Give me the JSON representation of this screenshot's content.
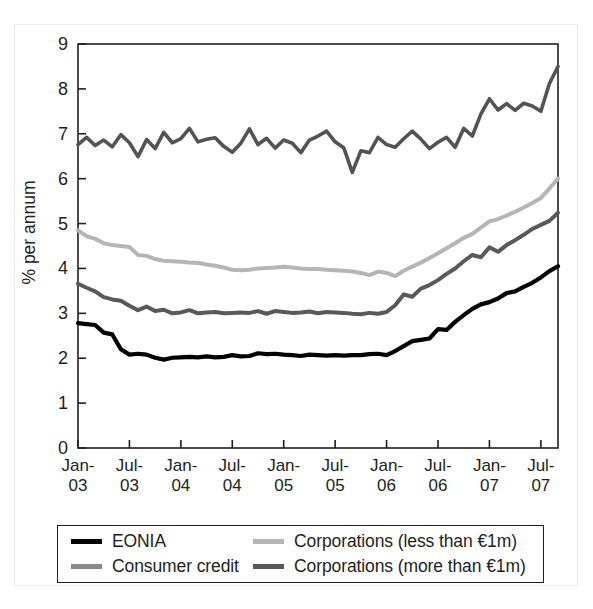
{
  "chart_data": {
    "type": "line",
    "title": "",
    "subtitle": "",
    "xlabel": "",
    "ylabel": "% per annum",
    "ylim": [
      0,
      9
    ],
    "yticks": [
      0,
      1,
      2,
      3,
      4,
      5,
      6,
      7,
      8,
      9
    ],
    "ytick_labels": [
      "0",
      "1",
      "2",
      "3",
      "4",
      "5",
      "6",
      "7",
      "8",
      "9"
    ],
    "grid": false,
    "legend_position": "below-plot",
    "x_start": "Jan-03",
    "x_end": "Sep-07",
    "x_frequency": "monthly",
    "xtick_labels": [
      {
        "line1": "Jan-",
        "line2": "03"
      },
      {
        "line1": "Jul-",
        "line2": "03"
      },
      {
        "line1": "Jan-",
        "line2": "04"
      },
      {
        "line1": "Jul-",
        "line2": "04"
      },
      {
        "line1": "Jan-",
        "line2": "05"
      },
      {
        "line1": "Jul-",
        "line2": "05"
      },
      {
        "line1": "Jan-",
        "line2": "06"
      },
      {
        "line1": "Jul-",
        "line2": "06"
      },
      {
        "line1": "Jan-",
        "line2": "07"
      },
      {
        "line1": "Jul-",
        "line2": "07"
      }
    ],
    "x": [
      "Jan-03",
      "Feb-03",
      "Mar-03",
      "Apr-03",
      "May-03",
      "Jun-03",
      "Jul-03",
      "Aug-03",
      "Sep-03",
      "Oct-03",
      "Nov-03",
      "Dec-03",
      "Jan-04",
      "Feb-04",
      "Mar-04",
      "Apr-04",
      "May-04",
      "Jun-04",
      "Jul-04",
      "Aug-04",
      "Sep-04",
      "Oct-04",
      "Nov-04",
      "Dec-04",
      "Jan-05",
      "Feb-05",
      "Mar-05",
      "Apr-05",
      "May-05",
      "Jun-05",
      "Jul-05",
      "Aug-05",
      "Sep-05",
      "Oct-05",
      "Nov-05",
      "Dec-05",
      "Jan-06",
      "Feb-06",
      "Mar-06",
      "Apr-06",
      "May-06",
      "Jun-06",
      "Jul-06",
      "Aug-06",
      "Sep-06",
      "Oct-06",
      "Nov-06",
      "Dec-06",
      "Jan-07",
      "Feb-07",
      "Mar-07",
      "Apr-07",
      "May-07",
      "Jun-07",
      "Jul-07",
      "Aug-07",
      "Sep-07"
    ],
    "series": [
      {
        "name": "EONIA",
        "color": "#000000",
        "width": 4.2,
        "values": [
          2.78,
          2.76,
          2.74,
          2.57,
          2.53,
          2.2,
          2.08,
          2.1,
          2.08,
          2.01,
          1.97,
          2.01,
          2.02,
          2.03,
          2.02,
          2.04,
          2.02,
          2.03,
          2.07,
          2.04,
          2.05,
          2.11,
          2.09,
          2.1,
          2.08,
          2.07,
          2.05,
          2.08,
          2.07,
          2.06,
          2.07,
          2.06,
          2.07,
          2.07,
          2.09,
          2.1,
          2.07,
          2.16,
          2.27,
          2.38,
          2.41,
          2.44,
          2.65,
          2.63,
          2.81,
          2.96,
          3.1,
          3.2,
          3.25,
          3.33,
          3.45,
          3.49,
          3.59,
          3.68,
          3.8,
          3.94,
          4.05
        ]
      },
      {
        "name": "Consumer credit",
        "color": "#545354",
        "width": 3.6,
        "values": [
          6.76,
          6.92,
          6.74,
          6.86,
          6.71,
          6.98,
          6.8,
          6.49,
          6.87,
          6.67,
          7.03,
          6.8,
          6.89,
          7.12,
          6.82,
          6.88,
          6.91,
          6.72,
          6.59,
          6.79,
          7.11,
          6.76,
          6.9,
          6.68,
          6.86,
          6.79,
          6.58,
          6.86,
          6.95,
          7.06,
          6.82,
          6.69,
          6.14,
          6.62,
          6.58,
          6.92,
          6.76,
          6.7,
          6.89,
          7.06,
          6.88,
          6.67,
          6.81,
          6.92,
          6.7,
          7.12,
          6.95,
          7.44,
          7.78,
          7.53,
          7.67,
          7.52,
          7.68,
          7.62,
          7.5,
          8.12,
          8.5
        ]
      },
      {
        "name": "Corporations (less than €1m)",
        "color": "#b4b5b7",
        "width": 4.0,
        "values": [
          4.85,
          4.72,
          4.66,
          4.56,
          4.52,
          4.5,
          4.48,
          4.3,
          4.28,
          4.21,
          4.17,
          4.16,
          4.15,
          4.13,
          4.12,
          4.09,
          4.06,
          4.02,
          3.97,
          3.96,
          3.97,
          4.0,
          4.01,
          4.02,
          4.04,
          4.02,
          4.0,
          3.99,
          3.99,
          3.97,
          3.96,
          3.95,
          3.93,
          3.9,
          3.85,
          3.93,
          3.9,
          3.83,
          3.95,
          4.04,
          4.13,
          4.23,
          4.34,
          4.45,
          4.56,
          4.68,
          4.77,
          4.91,
          5.05,
          5.1,
          5.18,
          5.26,
          5.36,
          5.46,
          5.57,
          5.78,
          6.0
        ]
      },
      {
        "name": "Corporations (more than €1m)",
        "color": "#59595b",
        "width": 4.0,
        "values": [
          3.66,
          3.57,
          3.49,
          3.36,
          3.31,
          3.28,
          3.17,
          3.07,
          3.15,
          3.05,
          3.08,
          3.0,
          3.02,
          3.07,
          3.0,
          3.02,
          3.03,
          3.0,
          3.01,
          3.02,
          3.01,
          3.05,
          2.99,
          3.05,
          3.03,
          3.01,
          3.02,
          3.04,
          3.0,
          3.03,
          3.02,
          3.01,
          2.99,
          2.98,
          3.01,
          2.99,
          3.03,
          3.18,
          3.42,
          3.37,
          3.55,
          3.63,
          3.74,
          3.88,
          4.0,
          4.16,
          4.3,
          4.25,
          4.47,
          4.37,
          4.52,
          4.63,
          4.75,
          4.88,
          4.97,
          5.06,
          5.24
        ]
      }
    ]
  },
  "legend": {
    "items": [
      {
        "label": "EONIA",
        "color": "#000000",
        "thickness": "5px"
      },
      {
        "label": "Corporations (less than €1m)",
        "color": "#b4b5b7",
        "thickness": "5px"
      },
      {
        "label": "Consumer credit",
        "color": "#898a8c",
        "thickness": "5px"
      },
      {
        "label": "Corporations (more than €1m)",
        "color": "#58595b",
        "thickness": "5px"
      }
    ]
  }
}
